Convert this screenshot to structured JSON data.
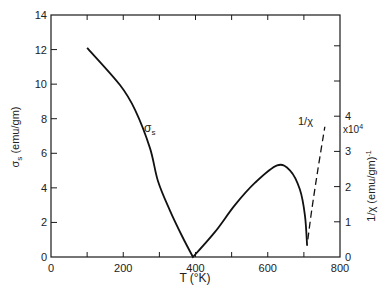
{
  "chart_data": {
    "type": "line",
    "title": "",
    "xlabel": "T (°K)",
    "ylabel": "σs (emu/gm)",
    "y2label": "1/χ (emu/gm)⁻¹",
    "y2_multiplier": "x10⁴",
    "xlim": [
      0,
      800
    ],
    "ylim": [
      0,
      14
    ],
    "y2lim": [
      0,
      6.9
    ],
    "x_ticks": [
      0,
      200,
      400,
      600,
      800
    ],
    "x_minor_ticks": [
      100,
      300,
      500,
      700
    ],
    "y_ticks": [
      0,
      2,
      4,
      6,
      8,
      10,
      12,
      14
    ],
    "y2_ticks": [
      0,
      1,
      2,
      3,
      4
    ],
    "y2_unlabeled_ticks": [
      5,
      6
    ],
    "grid": false,
    "legend": "none",
    "annotations": [
      {
        "text": "σs",
        "near_series": "sigma_s"
      },
      {
        "text": "1/χ",
        "near_series": "inverse_chi"
      }
    ],
    "series": [
      {
        "name": "σs",
        "axis": "left",
        "style": "solid",
        "x": [
          100,
          191,
          233,
          274,
          296,
          329,
          363,
          393,
          454,
          509,
          565,
          626,
          662,
          689,
          703,
          709
        ],
        "y": [
          12.1,
          9.95,
          8.5,
          6.3,
          4.4,
          2.7,
          1.2,
          0,
          1.45,
          3.0,
          4.3,
          5.3,
          5.0,
          3.9,
          2.4,
          0.65
        ]
      },
      {
        "name": "1/χ",
        "axis": "right",
        "style": "dashed",
        "x": [
          711,
          722,
          739,
          758
        ],
        "y": [
          0.5,
          1.35,
          2.5,
          3.7
        ]
      }
    ]
  },
  "labels": {
    "xlabel": "T (°K)",
    "ylabel_main": "σ",
    "ylabel_sub": "s",
    "ylabel_rest": " (emu/gm)",
    "y2label": "1/χ (emu/gm)",
    "y2label_sup": "-1",
    "y2_mult": "x10",
    "y2_mult_sup": "4",
    "sigma_annot": "σ",
    "sigma_annot_sub": "s",
    "chi_annot": "1/χ"
  }
}
